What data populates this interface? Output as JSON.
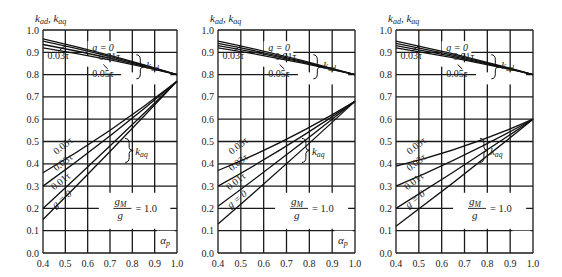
{
  "chart_data": [
    {
      "type": "line",
      "panel": 1,
      "ylabel": "k_ad, k_aq",
      "xlabel": "α_p",
      "xlim": [
        0.4,
        1.0
      ],
      "ylim": [
        0.0,
        1.0
      ],
      "x_ticks": [
        "0.4",
        "0.5",
        "0.6",
        "0.7",
        "0.8",
        "0.9",
        "1.0"
      ],
      "y_ticks": [
        "0.0",
        "0.1",
        "0.2",
        "0.3",
        "0.4",
        "0.5",
        "0.6",
        "0.7",
        "0.8",
        "0.9",
        "1.0"
      ],
      "grid": true,
      "annotation": "g_M / g = 1.0",
      "x": [
        0.4,
        1.0
      ],
      "kad_series": [
        {
          "name": "g = 0",
          "values": [
            0.96,
            0.8
          ]
        },
        {
          "name": "0.01τ",
          "values": [
            0.95,
            0.8
          ]
        },
        {
          "name": "0.03τ",
          "values": [
            0.935,
            0.8
          ]
        },
        {
          "name": "0.05τ",
          "values": [
            0.92,
            0.8
          ]
        }
      ],
      "kaq_series": [
        {
          "name": "0.05τ",
          "values": [
            0.36,
            0.77
          ]
        },
        {
          "name": "0.03τ",
          "values": [
            0.3,
            0.77
          ]
        },
        {
          "name": "0.01τ",
          "values": [
            0.2,
            0.77
          ]
        },
        {
          "name": "g = 0",
          "values": [
            0.15,
            0.77
          ]
        }
      ],
      "convergence": {
        "kad": 0.8,
        "kaq": 0.77
      }
    },
    {
      "type": "line",
      "panel": 2,
      "ylabel": "k_ad, k_aq",
      "xlabel": "α_p",
      "xlim": [
        0.4,
        1.0
      ],
      "ylim": [
        0.0,
        1.0
      ],
      "x_ticks": [
        "0.4",
        "0.5",
        "0.6",
        "0.7",
        "0.8",
        "0.9",
        "1.0"
      ],
      "y_ticks": [
        "0.0",
        "0.1",
        "0.2",
        "0.3",
        "0.4",
        "0.5",
        "0.6",
        "0.7",
        "0.8",
        "0.9",
        "1.0"
      ],
      "grid": true,
      "annotation": "g_M / g = 1.0",
      "x": [
        0.4,
        1.0
      ],
      "kad_series": [
        {
          "name": "g = 0",
          "values": [
            0.95,
            0.8
          ]
        },
        {
          "name": "0.01τ",
          "values": [
            0.94,
            0.8
          ]
        },
        {
          "name": "0.03τ",
          "values": [
            0.93,
            0.8
          ]
        },
        {
          "name": "0.05τ",
          "values": [
            0.92,
            0.8
          ]
        }
      ],
      "kaq_series": [
        {
          "name": "0.05τ",
          "values": [
            0.37,
            0.68
          ]
        },
        {
          "name": "0.03τ",
          "values": [
            0.3,
            0.68
          ]
        },
        {
          "name": "0.01τ",
          "values": [
            0.21,
            0.68
          ]
        },
        {
          "name": "g = 0",
          "values": [
            0.13,
            0.68
          ]
        }
      ],
      "convergence": {
        "kad": 0.8,
        "kaq": 0.68
      }
    },
    {
      "type": "line",
      "panel": 3,
      "ylabel": "k_ad, k_aq",
      "xlabel": "",
      "xlim": [
        0.4,
        1.0
      ],
      "ylim": [
        0.0,
        1.0
      ],
      "x_ticks": [
        "0.4",
        "0.5",
        "0.6",
        "0.7",
        "0.8",
        "0.9",
        "1.0"
      ],
      "y_ticks": [
        "0.0",
        "0.1",
        "0.2",
        "0.3",
        "0.4",
        "0.5",
        "0.6",
        "0.7",
        "0.8",
        "0.9",
        "1.0"
      ],
      "grid": true,
      "annotation": "g_M / g = 1.0",
      "x": [
        0.4,
        1.0
      ],
      "kad_series": [
        {
          "name": "g = 0",
          "values": [
            0.95,
            0.8
          ]
        },
        {
          "name": "0.01τ",
          "values": [
            0.94,
            0.8
          ]
        },
        {
          "name": "0.03τ",
          "values": [
            0.93,
            0.8
          ]
        },
        {
          "name": "0.05τ",
          "values": [
            0.92,
            0.8
          ]
        }
      ],
      "kaq_series": [
        {
          "name": "0.05τ",
          "values": [
            0.39,
            0.6
          ]
        },
        {
          "name": "0.03τ",
          "values": [
            0.3,
            0.6
          ]
        },
        {
          "name": "0.01τ",
          "values": [
            0.2,
            0.6
          ]
        },
        {
          "name": "g = 0",
          "values": [
            0.12,
            0.6
          ]
        }
      ],
      "convergence": {
        "kad": 0.8,
        "kaq": 0.6
      }
    }
  ],
  "labels": {
    "y_axis_title": "k",
    "y_sub_ad": "ad",
    "y_sub_aq": "aq",
    "kad": "k",
    "kad_sub": "ad",
    "kaq": "k",
    "kaq_sub": "aq",
    "g0": "g = 0",
    "t001": "0.01τ",
    "t003": "0.03τ",
    "t005": "0.05τ",
    "ratio_num": "g",
    "ratio_num_sub": "M",
    "ratio_den": "g",
    "ratio_eq": "= 1.0",
    "alpha": "α",
    "alpha_sub": "p"
  },
  "panels": [
    {
      "left": 43,
      "right": 177,
      "top": 30,
      "bottom": 253,
      "show_alpha": true
    },
    {
      "left": 218,
      "right": 355,
      "top": 30,
      "bottom": 253,
      "show_alpha": true
    },
    {
      "left": 396,
      "right": 533,
      "top": 30,
      "bottom": 253,
      "show_alpha": false
    }
  ]
}
